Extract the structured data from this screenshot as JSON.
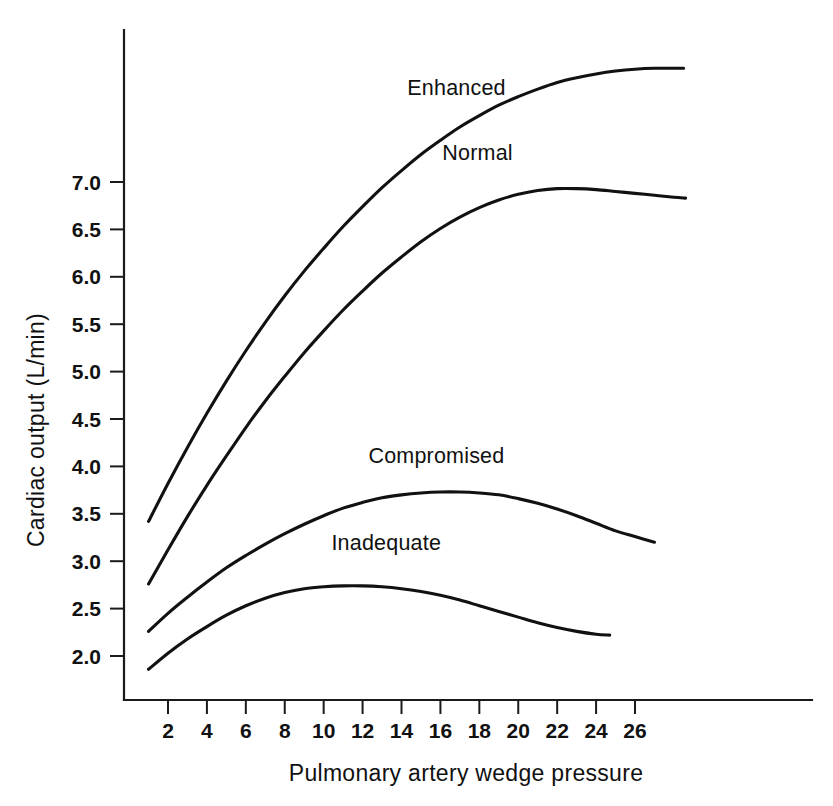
{
  "chart_data": {
    "type": "line",
    "title": "",
    "subtitle": "",
    "xlabel": "Pulmonary artery wedge pressure",
    "ylabel": "Cardiac output (L/min)",
    "xlim": [
      0,
      29
    ],
    "ylim": [
      1.55,
      8.2
    ],
    "grid": false,
    "legend_position": "inline-curve-labels",
    "x_ticks": [
      2,
      4,
      6,
      8,
      10,
      12,
      14,
      16,
      18,
      20,
      22,
      24,
      26
    ],
    "x_tick_labels": [
      "2",
      "4",
      "6",
      "8",
      "10",
      "12",
      "14",
      "16",
      "18",
      "20",
      "22",
      "24",
      "26"
    ],
    "y_ticks": [
      2.0,
      2.5,
      3.0,
      3.5,
      4.0,
      4.5,
      5.0,
      5.5,
      6.0,
      6.5,
      7.0
    ],
    "y_tick_labels": [
      "2.0",
      "2.5",
      "3.0",
      "3.5",
      "4.0",
      "4.5",
      "5.0",
      "5.5",
      "6.0",
      "6.5",
      "7.0"
    ],
    "series": [
      {
        "name": "Enhanced",
        "label_x": 14.3,
        "label_y": 7.92,
        "x": [
          1.0,
          2.0,
          3.0,
          4.0,
          5.0,
          6.0,
          7.0,
          8.0,
          9.0,
          10.0,
          11.0,
          12.0,
          13.0,
          14.0,
          15.0,
          16.0,
          17.0,
          18.0,
          19.0,
          20.0,
          21.0,
          22.0,
          23.0,
          24.0,
          25.0,
          26.0,
          27.0,
          28.0,
          28.5
        ],
        "y": [
          3.42,
          3.82,
          4.2,
          4.56,
          4.9,
          5.22,
          5.52,
          5.8,
          6.06,
          6.3,
          6.53,
          6.74,
          6.94,
          7.12,
          7.29,
          7.44,
          7.58,
          7.7,
          7.81,
          7.9,
          7.98,
          8.05,
          8.1,
          8.14,
          8.17,
          8.19,
          8.2,
          8.2,
          8.2
        ]
      },
      {
        "name": "Normal",
        "label_x": 16.1,
        "label_y": 7.23,
        "x": [
          1.0,
          2.0,
          3.0,
          4.0,
          5.0,
          6.0,
          7.0,
          8.0,
          9.0,
          10.0,
          11.0,
          12.0,
          13.0,
          14.0,
          15.0,
          16.0,
          17.0,
          18.0,
          19.0,
          20.0,
          21.0,
          22.0,
          23.0,
          24.0,
          25.0,
          26.0,
          27.0,
          28.0,
          28.6
        ],
        "y": [
          2.76,
          3.12,
          3.47,
          3.8,
          4.11,
          4.41,
          4.69,
          4.95,
          5.2,
          5.43,
          5.65,
          5.85,
          6.04,
          6.21,
          6.37,
          6.51,
          6.63,
          6.73,
          6.81,
          6.87,
          6.91,
          6.93,
          6.93,
          6.92,
          6.9,
          6.88,
          6.86,
          6.84,
          6.83
        ]
      },
      {
        "name": "Compromised",
        "label_x": 12.3,
        "label_y": 4.04,
        "x": [
          1.0,
          2.0,
          3.0,
          4.0,
          5.0,
          6.0,
          7.0,
          8.0,
          9.0,
          10.0,
          11.0,
          12.0,
          13.0,
          14.0,
          15.0,
          16.0,
          17.0,
          18.0,
          19.0,
          20.0,
          21.0,
          22.0,
          23.0,
          24.0,
          25.0,
          26.0,
          27.0
        ],
        "y": [
          2.26,
          2.45,
          2.62,
          2.78,
          2.93,
          3.06,
          3.18,
          3.29,
          3.39,
          3.48,
          3.56,
          3.62,
          3.67,
          3.7,
          3.72,
          3.73,
          3.73,
          3.72,
          3.7,
          3.66,
          3.61,
          3.55,
          3.48,
          3.4,
          3.32,
          3.26,
          3.2
        ]
      },
      {
        "name": "Inadequate",
        "label_x": 10.4,
        "label_y": 3.12,
        "x": [
          1.0,
          2.0,
          3.0,
          4.0,
          5.0,
          6.0,
          7.0,
          8.0,
          9.0,
          10.0,
          11.0,
          12.0,
          13.0,
          14.0,
          15.0,
          16.0,
          17.0,
          18.0,
          19.0,
          20.0,
          21.0,
          22.0,
          23.0,
          24.0,
          24.7
        ],
        "y": [
          1.86,
          2.03,
          2.18,
          2.31,
          2.43,
          2.53,
          2.61,
          2.67,
          2.71,
          2.73,
          2.74,
          2.74,
          2.73,
          2.71,
          2.68,
          2.64,
          2.59,
          2.53,
          2.47,
          2.41,
          2.35,
          2.3,
          2.26,
          2.23,
          2.22
        ]
      }
    ]
  }
}
